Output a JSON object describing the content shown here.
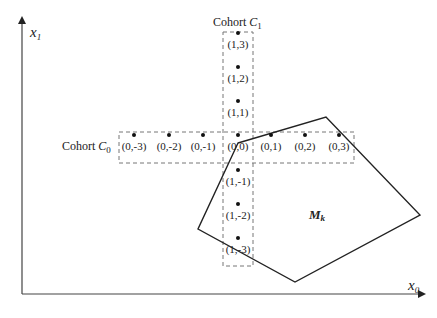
{
  "diagram": {
    "axes": {
      "x_label": "x",
      "x_sub": "0",
      "y_label": "x",
      "y_sub": "1"
    },
    "cohorts": [
      {
        "label": "Cohort ",
        "var": "C",
        "sub": "0",
        "orientation": "horizontal"
      },
      {
        "label": "Cohort ",
        "var": "C",
        "sub": "1",
        "orientation": "vertical"
      }
    ],
    "points": [
      {
        "label": "(0,-3)",
        "x": 134,
        "y": 143
      },
      {
        "label": "(0,-2)",
        "x": 169,
        "y": 143
      },
      {
        "label": "(0,-1)",
        "x": 203,
        "y": 143
      },
      {
        "label": "(0,0)",
        "x": 238,
        "y": 143
      },
      {
        "label": "(0,1)",
        "x": 271,
        "y": 143
      },
      {
        "label": "(0,2)",
        "x": 305,
        "y": 143
      },
      {
        "label": "(0,3)",
        "x": 339,
        "y": 143
      },
      {
        "label": "(1,3)",
        "x": 238,
        "y": 41
      },
      {
        "label": "(1,2)",
        "x": 238,
        "y": 75
      },
      {
        "label": "(1,1)",
        "x": 238,
        "y": 109
      },
      {
        "label": "(1,-1)",
        "x": 238,
        "y": 178
      },
      {
        "label": "(1,-2)",
        "x": 238,
        "y": 212
      },
      {
        "label": "(1,-3)",
        "x": 238,
        "y": 246
      }
    ],
    "region": {
      "label": "M",
      "sub": "k",
      "vertices": [
        [
          238,
          143
        ],
        [
          326,
          117
        ],
        [
          420,
          215
        ],
        [
          295,
          282
        ],
        [
          198,
          229
        ]
      ]
    }
  }
}
